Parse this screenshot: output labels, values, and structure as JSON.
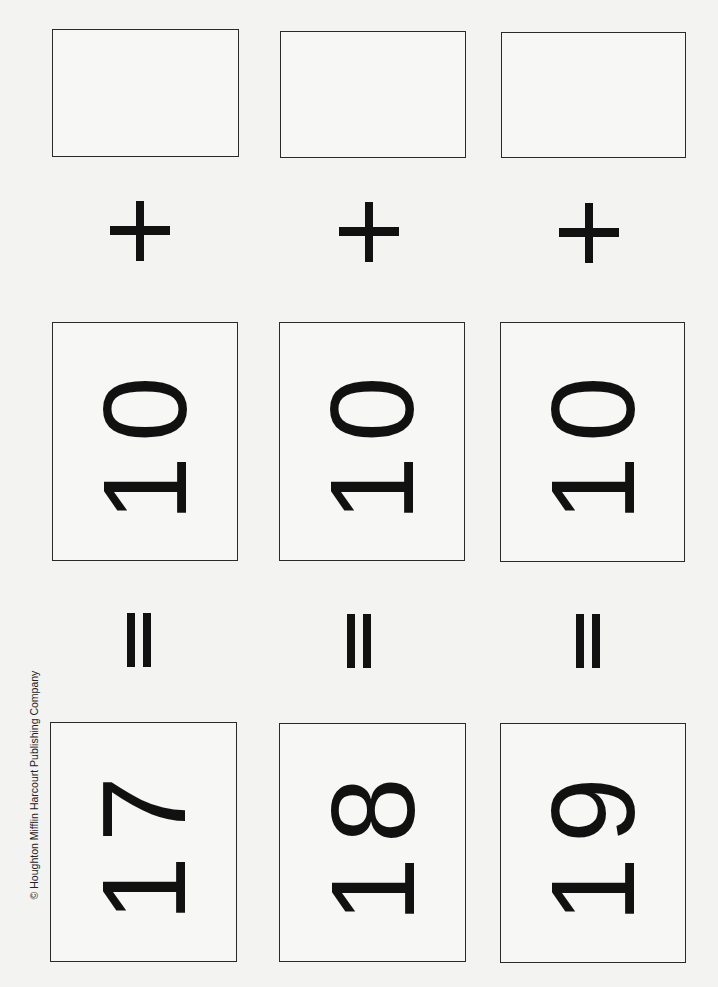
{
  "page": {
    "copyright": "© Houghton Mifflin Harcourt Publishing Company"
  },
  "cards": {
    "addend_row": [
      "",
      "",
      ""
    ],
    "operator_plus": "+",
    "tens_row": [
      "10",
      "10",
      "10"
    ],
    "operator_equals": "=",
    "sum_row": [
      "17",
      "18",
      "19"
    ]
  },
  "colors": {
    "ink": "#111111",
    "paper": "#f3f3f1",
    "border": "#2a2a2a"
  }
}
